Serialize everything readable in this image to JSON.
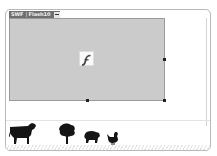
{
  "window": {
    "tabs": [
      {
        "label": "SWF"
      },
      {
        "label": "Flash10"
      }
    ],
    "tab_menu_icon": "minus-icon"
  },
  "stage": {
    "placeholder_icon": "flash-player-icon",
    "background": "#cbcbcb",
    "handles": [
      "bottom-middle",
      "bottom-right",
      "right-middle"
    ]
  },
  "library": {
    "items": [
      {
        "icon": "cow-silhouette-icon"
      },
      {
        "icon": "tree-silhouette-icon"
      },
      {
        "icon": "pig-silhouette-icon"
      },
      {
        "icon": "chicken-silhouette-icon"
      }
    ]
  }
}
